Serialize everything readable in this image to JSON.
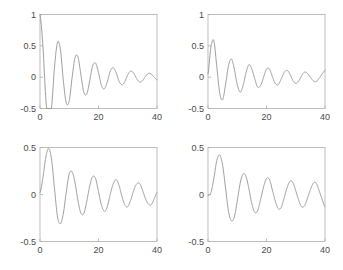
{
  "figure": {
    "title": "",
    "width": 343,
    "height": 270,
    "background": "#ffffff",
    "line_color": "#8c8c8c",
    "axis_color": "#aeaeae",
    "label_color": "#4a4a4a"
  },
  "panels": [
    {
      "name": "top-left",
      "xlabel": "",
      "ylabel": "",
      "xticklabels": [
        "0",
        "20",
        "40"
      ],
      "yticklabels": [
        "-0.5",
        "0",
        "0.5",
        "1"
      ]
    },
    {
      "name": "top-right",
      "xlabel": "",
      "ylabel": "",
      "xticklabels": [
        "0",
        "20",
        "40"
      ],
      "yticklabels": [
        "-0.5",
        "0",
        "0.5",
        "1"
      ]
    },
    {
      "name": "bottom-left",
      "xlabel": "",
      "ylabel": "",
      "xticklabels": [
        "0",
        "20",
        "40"
      ],
      "yticklabels": [
        "-0.5",
        "0",
        "0.5"
      ]
    },
    {
      "name": "bottom-right",
      "xlabel": "",
      "ylabel": "",
      "xticklabels": [
        "0",
        "20",
        "40"
      ],
      "yticklabels": [
        "-0.5",
        "0",
        "0.5"
      ]
    }
  ],
  "chart_data": [
    {
      "type": "line",
      "panel": "top-left",
      "title": "",
      "xlabel": "",
      "ylabel": "",
      "xlim": [
        0,
        40
      ],
      "ylim": [
        -0.5,
        1
      ],
      "xticks": [
        0,
        20,
        40
      ],
      "yticks": [
        -0.5,
        0,
        0.5,
        1
      ],
      "xticklabels": [
        "0",
        "20",
        "40"
      ],
      "yticklabels": [
        "-0.5",
        "0",
        "0.5",
        "1"
      ],
      "grid": false,
      "legend": null,
      "series": [
        {
          "name": "impulse-response-1",
          "description": "damped oscillation starting at 1, first trough -0.4 near t=3.2, period about 6.3",
          "model": "exp(-0.09*t)*cos(1.0*t)",
          "x": [
            0,
            1,
            2,
            3,
            4,
            5,
            6,
            7,
            8,
            9,
            10,
            11,
            12,
            13,
            14,
            15,
            16,
            17,
            18,
            19,
            20,
            21,
            22,
            23,
            24,
            25,
            26,
            27,
            28,
            29,
            30,
            31,
            32,
            33,
            34,
            35,
            36,
            37,
            38,
            39,
            40
          ],
          "y": [
            1.0,
            0.494,
            -0.347,
            -0.754,
            -0.456,
            0.181,
            0.558,
            0.432,
            -0.066,
            -0.414,
            -0.373,
            0.002,
            0.317,
            0.318,
            0.033,
            -0.242,
            -0.268,
            -0.057,
            0.182,
            0.224,
            0.07,
            -0.132,
            -0.185,
            -0.076,
            0.092,
            0.151,
            0.076,
            -0.061,
            -0.122,
            -0.071,
            0.037,
            0.097,
            0.065,
            -0.02,
            -0.076,
            -0.058,
            0.008,
            0.058,
            0.05,
            0.0,
            -0.043
          ]
        }
      ]
    },
    {
      "type": "line",
      "panel": "top-right",
      "title": "",
      "xlabel": "",
      "ylabel": "",
      "xlim": [
        0,
        40
      ],
      "ylim": [
        -0.5,
        1
      ],
      "xticks": [
        0,
        20,
        40
      ],
      "yticks": [
        -0.5,
        0,
        0.5,
        1
      ],
      "xticklabels": [
        "0",
        "20",
        "40"
      ],
      "yticklabels": [
        "-0.5",
        "0",
        "0.5",
        "1"
      ],
      "grid": false,
      "legend": null,
      "series": [
        {
          "name": "impulse-response-2",
          "description": "damped oscillation starting at 0, first peak 0.58 near t=1.8, first trough -0.36 near t=5",
          "model": "exp(-0.08*t)*sin(1.0*t)*0.62 + offset",
          "x": [
            0,
            1,
            2,
            3,
            4,
            5,
            6,
            7,
            8,
            9,
            10,
            11,
            12,
            13,
            14,
            15,
            16,
            17,
            18,
            19,
            20,
            21,
            22,
            23,
            24,
            25,
            26,
            27,
            28,
            29,
            30,
            31,
            32,
            33,
            34,
            35,
            36,
            37,
            38,
            39,
            40
          ],
          "y": [
            0.05,
            0.48,
            0.58,
            0.17,
            -0.25,
            -0.36,
            -0.12,
            0.18,
            0.29,
            0.13,
            -0.12,
            -0.24,
            -0.13,
            0.07,
            0.2,
            0.13,
            -0.03,
            -0.16,
            -0.13,
            0.0,
            0.13,
            0.13,
            0.01,
            -0.1,
            -0.12,
            -0.03,
            0.07,
            0.11,
            0.05,
            -0.05,
            -0.1,
            -0.06,
            0.02,
            0.08,
            0.06,
            0.0,
            -0.06,
            -0.07,
            -0.02,
            0.05,
            0.11
          ]
        }
      ]
    },
    {
      "type": "line",
      "panel": "bottom-left",
      "title": "",
      "xlabel": "",
      "ylabel": "",
      "xlim": [
        0,
        40
      ],
      "ylim": [
        -0.5,
        0.5
      ],
      "xticks": [
        0,
        20,
        40
      ],
      "yticks": [
        -0.5,
        0,
        0.5
      ],
      "xticklabels": [
        "0",
        "20",
        "40"
      ],
      "yticklabels": [
        "-0.5",
        "0",
        "0.5"
      ],
      "grid": false,
      "legend": null,
      "series": [
        {
          "name": "impulse-response-3",
          "description": "damped oscillation starting at 0, first peak 0.49 near t=3, first trough -0.30 near t=6.5",
          "model": "exp(-0.075*t)*sin(0.95*t) ramped",
          "x": [
            0,
            1,
            2,
            3,
            4,
            5,
            6,
            7,
            8,
            9,
            10,
            11,
            12,
            13,
            14,
            15,
            16,
            17,
            18,
            19,
            20,
            21,
            22,
            23,
            24,
            25,
            26,
            27,
            28,
            29,
            30,
            31,
            32,
            33,
            34,
            35,
            36,
            37,
            38,
            39,
            40
          ],
          "y": [
            0.02,
            0.18,
            0.4,
            0.49,
            0.36,
            0.05,
            -0.24,
            -0.31,
            -0.2,
            0.03,
            0.22,
            0.24,
            0.12,
            -0.07,
            -0.2,
            -0.2,
            -0.07,
            0.09,
            0.19,
            0.17,
            0.03,
            -0.11,
            -0.18,
            -0.13,
            0.0,
            0.11,
            0.16,
            0.1,
            -0.02,
            -0.11,
            -0.13,
            -0.06,
            0.04,
            0.11,
            0.12,
            0.05,
            -0.04,
            -0.1,
            -0.11,
            -0.05,
            0.02
          ]
        }
      ]
    },
    {
      "type": "line",
      "panel": "bottom-right",
      "title": "",
      "xlabel": "",
      "ylabel": "",
      "xlim": [
        0,
        40
      ],
      "ylim": [
        -0.5,
        0.5
      ],
      "xticks": [
        0,
        20,
        40
      ],
      "yticks": [
        -0.5,
        0,
        0.5
      ],
      "xticklabels": [
        "0",
        "20",
        "40"
      ],
      "yticklabels": [
        "-0.5",
        "0",
        "0.5"
      ],
      "grid": false,
      "legend": null,
      "series": [
        {
          "name": "impulse-response-4",
          "description": "damped oscillation with flat start, first peak 0.42 near t=3.8, first trough -0.29 near t=7.5",
          "model": "exp(-0.07*t)*sin(0.92*(t-0.8)) ramped",
          "x": [
            0,
            1,
            2,
            3,
            4,
            5,
            6,
            7,
            8,
            9,
            10,
            11,
            12,
            13,
            14,
            15,
            16,
            17,
            18,
            19,
            20,
            21,
            22,
            23,
            24,
            25,
            26,
            27,
            28,
            29,
            30,
            31,
            32,
            33,
            34,
            35,
            36,
            37,
            38,
            39,
            40
          ],
          "y": [
            -0.01,
            0.02,
            0.17,
            0.36,
            0.42,
            0.31,
            0.07,
            -0.18,
            -0.28,
            -0.24,
            -0.07,
            0.12,
            0.22,
            0.19,
            0.06,
            -0.1,
            -0.19,
            -0.17,
            -0.05,
            0.08,
            0.17,
            0.16,
            0.05,
            -0.07,
            -0.15,
            -0.14,
            -0.04,
            0.07,
            0.14,
            0.13,
            0.04,
            -0.06,
            -0.13,
            -0.12,
            -0.04,
            0.05,
            0.12,
            0.12,
            0.04,
            -0.05,
            -0.13
          ]
        }
      ]
    }
  ]
}
